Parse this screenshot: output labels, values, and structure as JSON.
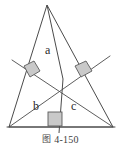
{
  "figure": {
    "kind": "geometry-diagram",
    "labels": {
      "a": "a",
      "b": "b",
      "c": "c"
    },
    "colors": {
      "stroke": "#4b4b4b",
      "marker_fill": "#c9c9c9",
      "marker_stroke": "#5a5a5a",
      "text": "#2b2b2b",
      "background": "#ffffff"
    },
    "points": {
      "apex": [
        47,
        5
      ],
      "bottom_left": [
        9,
        127
      ],
      "bottom_right": [
        113,
        127
      ],
      "orthocenter": [
        63,
        79
      ],
      "foot_left": [
        30,
        72
      ],
      "foot_right": [
        83,
        71
      ],
      "foot_base": [
        59,
        127
      ]
    }
  },
  "caption": {
    "glyph": "图",
    "text": "4-150",
    "full": "图 4-150"
  }
}
